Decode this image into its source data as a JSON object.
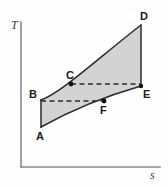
{
  "figure": {
    "background_color": "#fefefe"
  },
  "axes": {
    "y_axis": {
      "label": "T",
      "name": "temperature-axis",
      "color": "#8a8a8a",
      "x": 21,
      "y_top": 22,
      "y_bottom": 167
    },
    "x_axis": {
      "label": "s",
      "name": "entropy-axis",
      "color": "#8a8a8a",
      "y": 167,
      "x_left": 21,
      "x_right": 160
    }
  },
  "region": {
    "name": "shaded-process-area",
    "fill_color": "#d3d3d3",
    "stroke_color": "#2b2b2b",
    "path": "M 41 127 L 41 100 C 62 92 96 60 141 25 L 141 86 C 106 96 68 112 41 127 Z"
  },
  "curves": [
    {
      "name": "upper-curve-b-c-d",
      "from": "B",
      "through": "C",
      "to": "D",
      "path": "M 41 100 C 62 92 96 60 141 25"
    },
    {
      "name": "lower-curve-a-f-e",
      "from": "A",
      "through": "F",
      "to": "E",
      "path": "M 41 127 C 68 112 106 96 141 86"
    }
  ],
  "edges": [
    {
      "name": "left-edge-a-b",
      "from": "A",
      "to": "B",
      "x1": 41,
      "y1": 127,
      "x2": 41,
      "y2": 100
    },
    {
      "name": "right-edge-d-e",
      "from": "D",
      "to": "E",
      "x1": 141,
      "y1": 25,
      "x2": 141,
      "y2": 86
    }
  ],
  "dashed_lines": [
    {
      "name": "dashed-line-b-f",
      "from": "B",
      "to": "F",
      "x1": 41,
      "y1": 101,
      "x2": 104,
      "y2": 101
    },
    {
      "name": "dashed-line-c-e",
      "from": "C",
      "to": "E",
      "x1": 71,
      "y1": 84,
      "x2": 141,
      "y2": 84
    }
  ],
  "points": [
    {
      "id": "A",
      "label": "A",
      "x": 41,
      "y": 127,
      "marker": false,
      "label_x": 36,
      "label_y": 140
    },
    {
      "id": "B",
      "label": "B",
      "x": 41,
      "y": 100,
      "marker": false,
      "label_x": 29,
      "label_y": 98
    },
    {
      "id": "C",
      "label": "C",
      "x": 71,
      "y": 84,
      "marker": true,
      "label_x": 66,
      "label_y": 79
    },
    {
      "id": "D",
      "label": "D",
      "x": 141,
      "y": 25,
      "marker": false,
      "label_x": 140,
      "label_y": 20
    },
    {
      "id": "E",
      "label": "E",
      "x": 141,
      "y": 86,
      "marker": true,
      "label_x": 143,
      "label_y": 98
    },
    {
      "id": "F",
      "label": "F",
      "x": 104,
      "y": 101,
      "marker": true,
      "label_x": 100,
      "label_y": 114
    }
  ],
  "colors": {
    "fill": "#d3d3d3",
    "stroke": "#2b2b2b",
    "axis": "#8a8a8a",
    "label": "#1a1a1a",
    "axis_label": "#3a3a3a"
  }
}
